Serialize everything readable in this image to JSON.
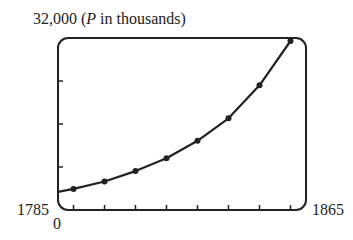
{
  "chart_data": {
    "type": "line",
    "title": "",
    "ylabel": "P in thousands",
    "xlabel": "",
    "x": [
      1790,
      1800,
      1810,
      1820,
      1830,
      1840,
      1850,
      1860
    ],
    "series": [
      {
        "name": "Population (thousands)",
        "values": [
          3929,
          5308,
          7240,
          9638,
          12866,
          17069,
          23192,
          31443
        ]
      }
    ],
    "xlim": [
      1785,
      1865
    ],
    "ylim": [
      0,
      32000
    ],
    "yticks": [
      8000,
      16000,
      24000
    ],
    "grid": false,
    "labels": {
      "ymax": "32,000",
      "yunit_prefix": "(",
      "yunit_var": "P",
      "yunit_rest": " in thousands)",
      "xmin": "1785",
      "xmax": "1865",
      "ymin": "0"
    }
  }
}
